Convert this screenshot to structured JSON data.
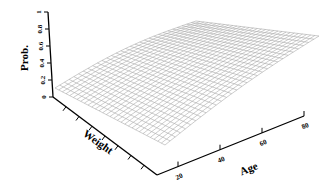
{
  "chart_data": {
    "type": "surface",
    "title": "",
    "xlabel": "Age",
    "ylabel": "Weight",
    "zlabel": "Prob.",
    "x_ticks": [
      "20",
      "40",
      "60",
      "80"
    ],
    "x_tick_values": [
      20,
      40,
      60,
      80
    ],
    "x_range": [
      10,
      80
    ],
    "y_ticks": [
      "",
      "",
      "",
      "",
      "",
      "",
      ""
    ],
    "y_tick_count": 7,
    "z_ticks": [
      "0",
      "0.2",
      "0.4",
      "0.6",
      "0.8",
      "1"
    ],
    "z_tick_values": [
      0,
      0.2,
      0.4,
      0.6,
      0.8,
      1.0
    ],
    "z_range": [
      0,
      1
    ],
    "grid": false,
    "legend": null,
    "surface": {
      "description": "Wireframe probability surface rising with Age and Weight",
      "corners": {
        "age_min_weight_min": 0.1,
        "age_min_weight_max": 0.05,
        "age_max_weight_min": 0.7,
        "age_max_weight_max": 0.45
      },
      "mesh_rows": 30,
      "mesh_cols": 30
    }
  }
}
